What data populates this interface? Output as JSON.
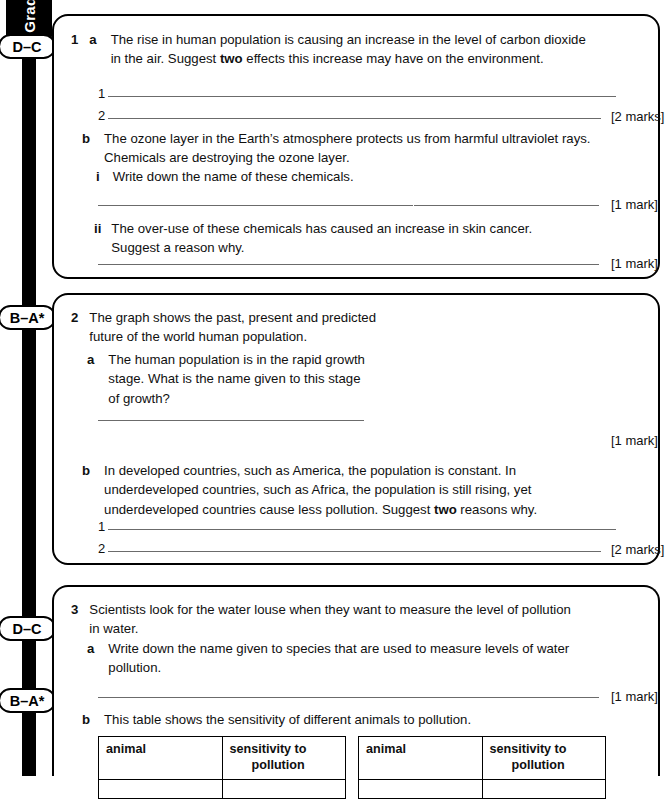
{
  "sidebar": {
    "tab_label": "Grades",
    "badges": [
      {
        "label": "D–C"
      },
      {
        "label": "B–A*"
      },
      {
        "label": "D–C"
      },
      {
        "label": "B–A*"
      }
    ]
  },
  "questions": [
    {
      "number": "1",
      "parts": [
        {
          "letter": "a",
          "text_lines": [
            "The rise in human population is causing an increase in the level of carbon dioxide",
            "in the air. Suggest two effects this increase may have on the environment."
          ],
          "bold_word": "two",
          "answer_numbers": [
            "1",
            "2"
          ],
          "marks": "[2 marks]"
        },
        {
          "letter": "b",
          "text_lines": [
            "The ozone layer in the Earth’s atmosphere protects us from harmful ultraviolet rays.",
            "Chemicals are destroying the ozone layer."
          ],
          "subparts": [
            {
              "numeral": "i",
              "text_lines": [
                "Write down the name of these chemicals."
              ],
              "marks": "[1 mark]"
            },
            {
              "numeral": "ii",
              "text_lines": [
                "The over-use of these chemicals has caused an increase in skin cancer.",
                "Suggest a reason why."
              ],
              "marks": "[1 mark]"
            }
          ]
        }
      ]
    },
    {
      "number": "2",
      "stem_lines": [
        "The graph shows the past, present and predicted",
        "future of the world human population."
      ],
      "parts": [
        {
          "letter": "a",
          "text_lines": [
            "The human population is in the rapid growth",
            "stage. What is the name given to this stage",
            "of growth?"
          ],
          "marks": "[1 mark]"
        },
        {
          "letter": "b",
          "text_lines": [
            "In developed countries, such as America, the population is constant. In",
            "underdeveloped countries, such as Africa, the population is still rising, yet",
            "underdeveloped countries cause less pollution. Suggest two reasons why."
          ],
          "bold_word": "two",
          "answer_numbers": [
            "1",
            "2"
          ],
          "marks": "[2 marks]"
        }
      ]
    },
    {
      "number": "3",
      "stem_lines": [
        "Scientists look for the water louse when they want to measure the level of pollution",
        "in water."
      ],
      "parts": [
        {
          "letter": "a",
          "text_lines": [
            "Write down the name given to species that are used to measure levels of water",
            "pollution."
          ],
          "marks": "[1 mark]"
        },
        {
          "letter": "b",
          "text_lines": [
            "This table shows the sensitivity of different animals to pollution."
          ],
          "tables": [
            {
              "headers": [
                "animal",
                "sensitivity to pollution"
              ]
            },
            {
              "headers": [
                "animal",
                "sensitivity to pollution"
              ]
            }
          ]
        }
      ]
    }
  ],
  "chart_data": {
    "type": "area",
    "title": "",
    "xlabel": "year",
    "ylabel": "population (billions)",
    "xlim": [
      1750,
      2150
    ],
    "ylim": [
      0,
      11
    ],
    "xticks": [
      1750,
      1800,
      1850,
      1900,
      1950,
      2000,
      2050,
      2100,
      2150
    ],
    "yticks": [
      0,
      2,
      4,
      6,
      8,
      10
    ],
    "grid": false,
    "legend_position": "inside-left",
    "stacked": true,
    "annotations": [
      {
        "text_lines": [
          "year 2000",
          "6.1 billion"
        ],
        "x": 2000,
        "y": 6.1
      }
    ],
    "x": [
      1750,
      1800,
      1850,
      1900,
      1950,
      2000,
      2050,
      2100,
      2150
    ],
    "series": [
      {
        "name": "developed countries",
        "color": "#b3b3b3",
        "values": [
          0.2,
          0.25,
          0.35,
          0.55,
          0.8,
          1.2,
          1.35,
          1.35,
          1.35
        ]
      },
      {
        "name": "underdeveloped countries",
        "color": "#7d7d7d",
        "values": [
          0.55,
          0.7,
          0.9,
          1.1,
          1.7,
          4.9,
          7.4,
          9.0,
          9.3
        ]
      }
    ],
    "totals": [
      0.75,
      0.95,
      1.25,
      1.65,
      2.5,
      6.1,
      8.75,
      10.35,
      10.65
    ]
  }
}
